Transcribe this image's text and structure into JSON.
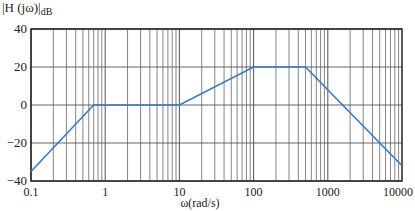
{
  "chart_data": {
    "type": "line",
    "title": "",
    "ylabel": "|H(jω)|dB",
    "ylabel_parts": {
      "main": "|H (jω)|",
      "sub": "dB"
    },
    "xlabel": "ω(rad/s)",
    "xscale": "log",
    "xlim": [
      0.1,
      10000
    ],
    "ylim": [
      -40,
      40
    ],
    "xticks": [
      0.1,
      1,
      10,
      100,
      1000,
      10000
    ],
    "xtick_labels": [
      "0.1",
      "1",
      "10",
      "100",
      "1000",
      "10000"
    ],
    "yticks": [
      -40,
      -20,
      0,
      20,
      40
    ],
    "ytick_labels": [
      "−40",
      "−20",
      "0",
      "20",
      "40"
    ],
    "grid": true,
    "series": [
      {
        "name": "Bode magnitude (asymptotic)",
        "color": "#3a78c4",
        "x": [
          0.1,
          0.7,
          10,
          100,
          500,
          10000
        ],
        "y": [
          -35,
          0,
          0,
          20,
          20,
          -32
        ]
      }
    ]
  },
  "colors": {
    "line": "#3a78c4",
    "grid_major": "#555555",
    "grid_minor": "#666666",
    "frame": "#222222"
  }
}
